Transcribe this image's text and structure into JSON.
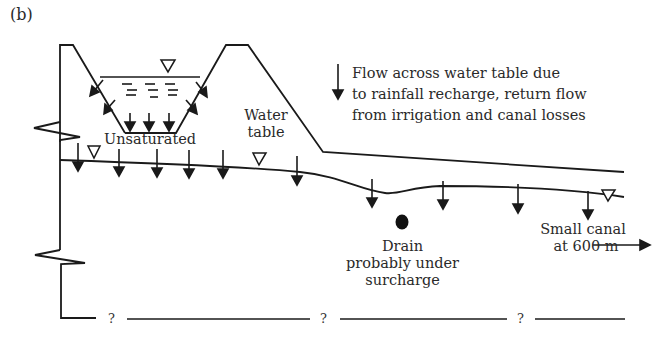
{
  "panel_label": "(b)",
  "legend": {
    "icon": "down-arrow-icon",
    "lines": [
      "Flow across water table due",
      "to rainfall recharge, return flow",
      "from irrigation and canal losses"
    ]
  },
  "labels": {
    "unsaturated": "Unsaturated",
    "water_table_line1": "Water",
    "water_table_line2": "table",
    "drain_line1": "Drain",
    "drain_line2": "probably under",
    "drain_line3": "surcharge",
    "canal_line1": "Small canal",
    "canal_line2": "at 600 m"
  },
  "base_markers": [
    "?",
    "?",
    "?"
  ],
  "colors": {
    "line": "#1a1a1a",
    "text": "#2a2a2a",
    "background": "#ffffff"
  }
}
